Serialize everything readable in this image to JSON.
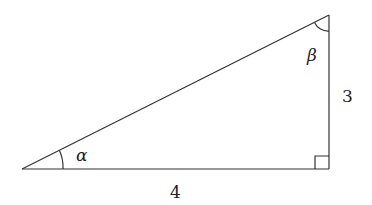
{
  "diagram": {
    "type": "right-triangle",
    "colors": {
      "stroke": "#333333",
      "background": "#ffffff",
      "text": "#222222"
    },
    "vertices": {
      "A": [
        22,
        169
      ],
      "C": [
        329,
        169
      ],
      "B": [
        329,
        15
      ]
    },
    "labels": {
      "side_bottom": "4",
      "side_right": "3",
      "angle_alpha": "α",
      "angle_beta": "β"
    },
    "right_angle_marker": true
  }
}
